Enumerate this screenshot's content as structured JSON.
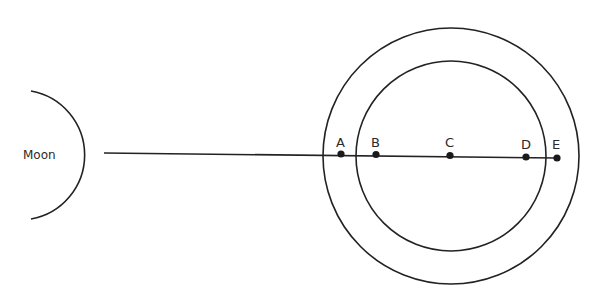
{
  "diagram": {
    "moon": {
      "label": "Moon",
      "cx": 40,
      "cy": 155,
      "r": 65
    },
    "outer_circle": {
      "cx": 451,
      "cy": 156,
      "r": 128
    },
    "inner_circle": {
      "cx": 451,
      "cy": 156,
      "r": 95
    },
    "line": {
      "x1": 104,
      "y1": 153,
      "x2": 557,
      "y2": 158
    },
    "points": [
      {
        "label": "A",
        "x": 341,
        "y": 154
      },
      {
        "label": "B",
        "x": 376,
        "y": 154.5
      },
      {
        "label": "C",
        "x": 450,
        "y": 155.5
      },
      {
        "label": "D",
        "x": 526,
        "y": 157
      },
      {
        "label": "E",
        "x": 557,
        "y": 158
      }
    ],
    "colors": {
      "stroke": "#222222",
      "background": "#ffffff"
    }
  }
}
